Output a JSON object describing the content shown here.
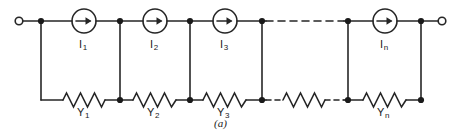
{
  "figure": {
    "caption": "(a)",
    "colors": {
      "wire": "#262626",
      "text": "#1a1a1a",
      "background": "#ffffff"
    }
  },
  "terminals": [
    {
      "name": "left-terminal",
      "cx": 19,
      "cy": 21,
      "r": 4
    },
    {
      "name": "right-terminal",
      "cx": 442,
      "cy": 21,
      "r": 4
    }
  ],
  "sources": [
    {
      "id": "I1",
      "label": "I",
      "sub": "1",
      "cx": 84,
      "cy": 21,
      "r": 12,
      "label_x": 79,
      "label_y": 38
    },
    {
      "id": "I2",
      "label": "I",
      "sub": "2",
      "cx": 155,
      "cy": 21,
      "r": 12,
      "label_x": 150,
      "label_y": 38
    },
    {
      "id": "I3",
      "label": "I",
      "sub": "3",
      "cx": 225,
      "cy": 21,
      "r": 12,
      "label_x": 220,
      "label_y": 38
    },
    {
      "id": "In",
      "label": "I",
      "sub": "n",
      "cx": 385,
      "cy": 21,
      "r": 12,
      "label_x": 380,
      "label_y": 38
    }
  ],
  "admittances": [
    {
      "id": "Y1",
      "label": "Y",
      "sub": "1",
      "x1": 63,
      "x2": 105,
      "label_x": 77,
      "label_y": 106
    },
    {
      "id": "Y2",
      "label": "Y",
      "sub": "2",
      "x1": 133,
      "x2": 176,
      "label_x": 147,
      "label_y": 106
    },
    {
      "id": "Y3",
      "label": "Y",
      "sub": "3",
      "x1": 203,
      "x2": 246,
      "label_x": 217,
      "label_y": 106
    },
    {
      "id": "Ymid",
      "label": "",
      "sub": "",
      "x1": 283,
      "x2": 325,
      "label_x": 0,
      "label_y": 0
    },
    {
      "id": "Yn",
      "label": "Y",
      "sub": "n",
      "x1": 363,
      "x2": 406,
      "label_x": 377,
      "label_y": 106
    }
  ],
  "nodes": [
    {
      "name": "node-top-1",
      "x": 41,
      "y": 21
    },
    {
      "name": "node-top-2",
      "x": 120,
      "y": 21
    },
    {
      "name": "node-top-3",
      "x": 190,
      "y": 21
    },
    {
      "name": "node-top-4",
      "x": 262,
      "y": 21
    },
    {
      "name": "node-top-5",
      "x": 348,
      "y": 21
    },
    {
      "name": "node-top-6",
      "x": 421,
      "y": 21
    },
    {
      "name": "node-bottom-2",
      "x": 120,
      "y": 100
    },
    {
      "name": "node-bottom-3",
      "x": 190,
      "y": 100
    },
    {
      "name": "node-bottom-4",
      "x": 262,
      "y": 100
    },
    {
      "name": "node-bottom-5",
      "x": 348,
      "y": 100
    },
    {
      "name": "node-bottom-6",
      "x": 421,
      "y": 100
    }
  ],
  "rails": {
    "top_y": 21,
    "bottom_y": 100
  },
  "dashes": [
    {
      "name": "top-dashed-gap",
      "x1": 266,
      "x2": 344,
      "y": 21
    },
    {
      "name": "bottom-dashed-gap-left",
      "x1": 266,
      "x2": 283,
      "y": 100
    },
    {
      "name": "bottom-dashed-gap-right",
      "x1": 325,
      "x2": 344,
      "y": 100
    }
  ],
  "caption_pos": {
    "x": 214,
    "y": 118
  }
}
